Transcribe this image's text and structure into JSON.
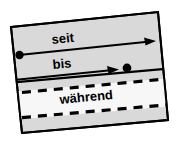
{
  "figure": {
    "type": "timeline-preposition-diagram",
    "background_color": "#ffffff",
    "panel_fill_color": "#d9d9d9",
    "band_fill_color": "#f7f7f7",
    "stroke_color": "#000000",
    "rotation_degrees": -9,
    "labels": {
      "seit": "seit",
      "bis": "bis",
      "waehrend": "während"
    },
    "annotations": [
      {
        "name": "seit",
        "label": "seit",
        "marker_start": "filled-dot",
        "marker_end": "arrowhead",
        "line_style": "solid"
      },
      {
        "name": "bis",
        "label": "bis",
        "marker_start": "line-from-edge",
        "marker_end": "arrowhead-then-filled-dot",
        "line_style": "solid"
      },
      {
        "name": "waehrend",
        "label": "während",
        "marker_start": "none",
        "marker_end": "none",
        "line_style": "dashed-band"
      }
    ]
  }
}
